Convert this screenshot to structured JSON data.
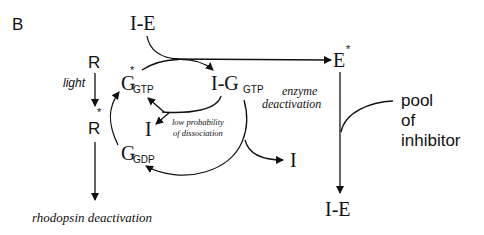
{
  "panel_label": "B",
  "nodes": {
    "ie_top": "I-E",
    "r": "R",
    "r_star": {
      "base": "R",
      "sup": "*"
    },
    "g_gtp_star": {
      "base": "G",
      "sub": "GTP",
      "sup": "*"
    },
    "i_g_gtp": {
      "base": "I-G",
      "sub": "GTP"
    },
    "i_small": "I",
    "g_gdp": {
      "base": "G",
      "sub": "GDP"
    },
    "i_released": "I",
    "e_star": {
      "base": "E",
      "sup": "*"
    },
    "ie_bottom": "I-E"
  },
  "labels": {
    "light": "light",
    "low_probability_line1": "low probability",
    "low_probability_line2": "of dissociation",
    "enzyme_deactivation_line1": "enzyme",
    "enzyme_deactivation_line2": "deactivation",
    "pool_line1": "pool",
    "pool_line2": "of",
    "pool_line3": "inhibitor",
    "rhodopsin_deactivation": "rhodopsin deactivation"
  },
  "colors": {
    "ink": "#111111",
    "background": "#ffffff"
  }
}
